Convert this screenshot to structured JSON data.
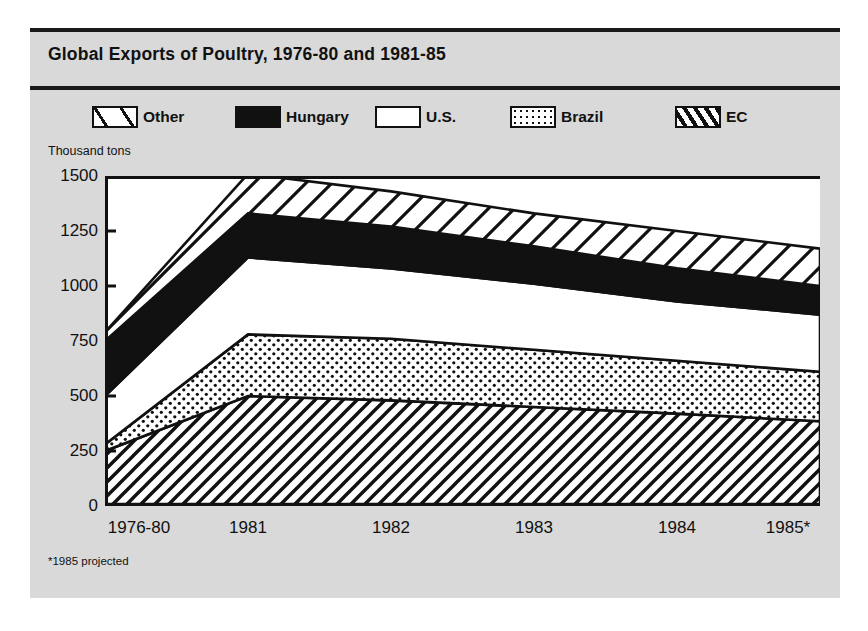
{
  "card": {
    "title": "Global Exports of Poultry, 1976-80 and 1981-85",
    "unit_label": "Thousand tons",
    "footnote": "*1985 projected",
    "background_color": "#d9d9d9",
    "plot_background_color": "#ffffff",
    "ink_color": "#111111"
  },
  "legend": {
    "items": [
      {
        "label": "Other",
        "pattern": "diag-wide",
        "swatch_name": "legend-swatch-other"
      },
      {
        "label": "Hungary",
        "pattern": "solid",
        "swatch_name": "legend-swatch-hungary"
      },
      {
        "label": "U.S.",
        "pattern": "plain",
        "swatch_name": "legend-swatch-us"
      },
      {
        "label": "Brazil",
        "pattern": "dots",
        "swatch_name": "legend-swatch-brazil"
      },
      {
        "label": "EC",
        "pattern": "diag-dense",
        "swatch_name": "legend-swatch-ec"
      }
    ]
  },
  "chart_data": {
    "type": "area",
    "stacked": true,
    "title": "Global Exports of Poultry, 1976-80 and 1981-85",
    "xlabel": "",
    "ylabel": "Thousand tons",
    "ylim": [
      0,
      1500
    ],
    "yticks": [
      0,
      250,
      500,
      750,
      1000,
      1250,
      1500
    ],
    "grid": false,
    "legend_position": "top",
    "categories": [
      "1976-80",
      "1981",
      "1982",
      "1983",
      "1984",
      "1985*"
    ],
    "series": [
      {
        "name": "EC",
        "pattern": "diag-dense",
        "values": [
          250,
          500,
          480,
          450,
          420,
          385
        ]
      },
      {
        "name": "Brazil",
        "pattern": "dots",
        "values": [
          30,
          280,
          280,
          260,
          240,
          225
        ]
      },
      {
        "name": "U.S.",
        "pattern": "plain",
        "values": [
          220,
          350,
          320,
          300,
          270,
          260
        ]
      },
      {
        "name": "Hungary",
        "pattern": "solid",
        "values": [
          250,
          200,
          190,
          170,
          150,
          130
        ]
      },
      {
        "name": "Other",
        "pattern": "diag-wide",
        "values": [
          40,
          180,
          160,
          150,
          170,
          170
        ]
      }
    ],
    "cumulative_tops": {
      "EC": [
        250,
        500,
        480,
        450,
        420,
        385
      ],
      "Brazil": [
        280,
        780,
        760,
        710,
        660,
        610
      ],
      "U.S.": [
        500,
        1130,
        1080,
        1010,
        930,
        870
      ],
      "Hungary": [
        750,
        1330,
        1270,
        1180,
        1080,
        1000
      ],
      "Other": [
        790,
        1510,
        1430,
        1330,
        1250,
        1170
      ]
    }
  }
}
